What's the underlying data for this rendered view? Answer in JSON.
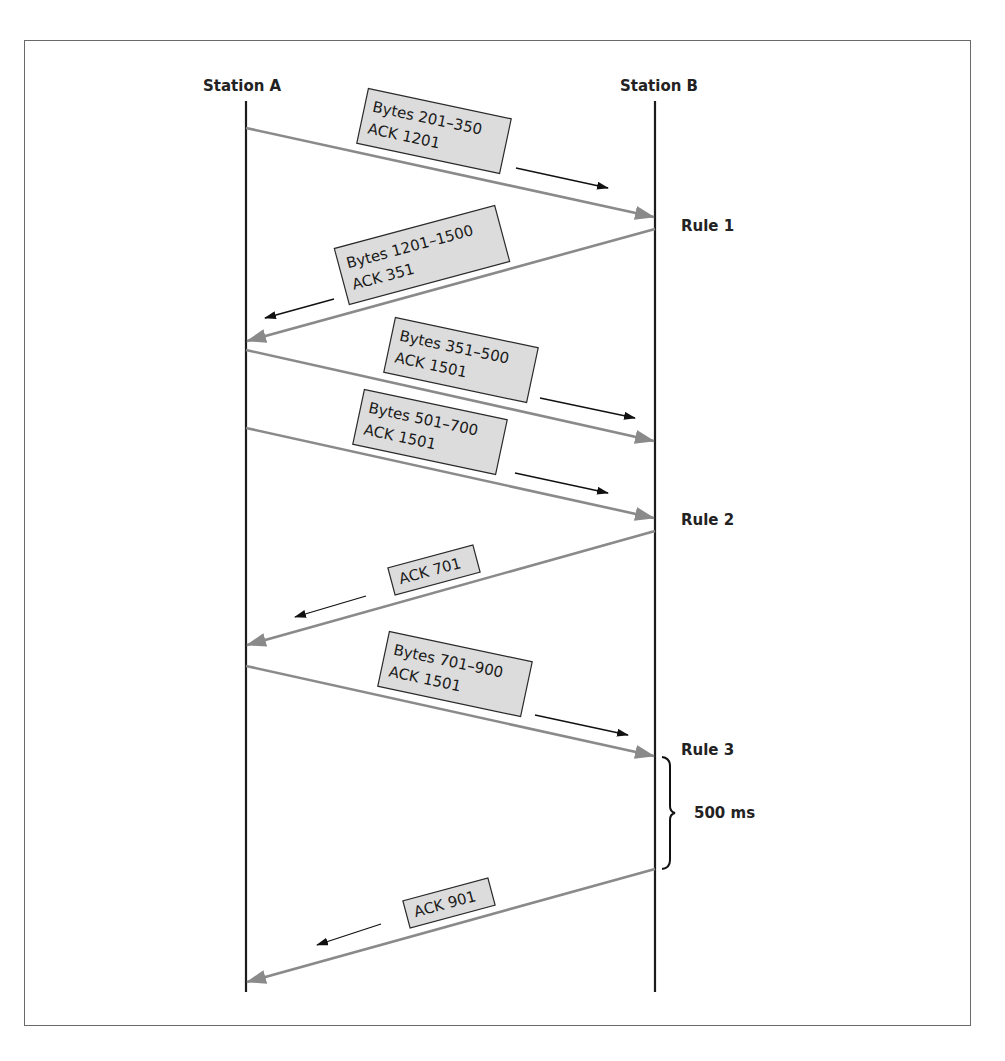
{
  "diagram": {
    "type": "sequence-diagram",
    "stations": [
      {
        "id": "A",
        "label": "Station A",
        "x": 246
      },
      {
        "id": "B",
        "label": "Station B",
        "x": 655
      }
    ],
    "lifeline": {
      "top": 101,
      "bottom": 992
    },
    "messages": [
      {
        "from": "A",
        "to": "B",
        "y_start": 128,
        "y_end": 217,
        "lines": [
          "Bytes 201–350",
          "ACK 1201"
        ],
        "box": {
          "cx": 434,
          "cy": 131,
          "w": 146,
          "h": 56,
          "angle": 12
        },
        "dir": {
          "x1": 516,
          "y1": 168,
          "x2": 608,
          "y2": 188
        }
      },
      {
        "from": "B",
        "to": "A",
        "y_start": 229,
        "y_end": 341,
        "lines": [
          "Bytes 1201–1500",
          "ACK 351"
        ],
        "box": {
          "cx": 422,
          "cy": 255,
          "w": 166,
          "h": 58,
          "angle": -15
        },
        "dir": {
          "x1": 334,
          "y1": 299,
          "x2": 265,
          "y2": 318
        }
      },
      {
        "from": "A",
        "to": "B",
        "y_start": 350,
        "y_end": 441,
        "lines": [
          "Bytes 351–500",
          "ACK 1501"
        ],
        "box": {
          "cx": 461,
          "cy": 360,
          "w": 146,
          "h": 56,
          "angle": 12
        },
        "dir": {
          "x1": 540,
          "y1": 398,
          "x2": 635,
          "y2": 418
        }
      },
      {
        "from": "A",
        "to": "B",
        "y_start": 428,
        "y_end": 518,
        "lines": [
          "Bytes 501–700",
          "ACK 1501"
        ],
        "box": {
          "cx": 430,
          "cy": 432,
          "w": 146,
          "h": 56,
          "angle": 12
        },
        "dir": {
          "x1": 515,
          "y1": 473,
          "x2": 608,
          "y2": 493
        }
      },
      {
        "from": "B",
        "to": "A",
        "y_start": 531,
        "y_end": 645,
        "lines": [
          "ACK 701"
        ],
        "box": {
          "cx": 434,
          "cy": 570,
          "w": 88,
          "h": 28,
          "angle": -15
        },
        "dir": {
          "x1": 366,
          "y1": 596,
          "x2": 295,
          "y2": 617
        }
      },
      {
        "from": "A",
        "to": "B",
        "y_start": 666,
        "y_end": 756,
        "lines": [
          "Bytes 701–900",
          "ACK 1501"
        ],
        "box": {
          "cx": 455,
          "cy": 674,
          "w": 146,
          "h": 56,
          "angle": 12
        },
        "dir": {
          "x1": 535,
          "y1": 715,
          "x2": 628,
          "y2": 735
        }
      },
      {
        "from": "B",
        "to": "A",
        "y_start": 869,
        "y_end": 982,
        "lines": [
          "ACK 901"
        ],
        "box": {
          "cx": 449,
          "cy": 903,
          "w": 88,
          "h": 28,
          "angle": -15
        },
        "dir": {
          "x1": 381,
          "y1": 924,
          "x2": 317,
          "y2": 945
        }
      }
    ],
    "rules": [
      {
        "label": "Rule 1",
        "x": 681,
        "y": 231
      },
      {
        "label": "Rule 2",
        "x": 681,
        "y": 525
      },
      {
        "label": "Rule 3",
        "x": 681,
        "y": 755
      }
    ],
    "timer": {
      "label": "500 ms",
      "x": 694,
      "y": 818,
      "brace_top": 756,
      "brace_bottom": 869,
      "brace_x": 663
    },
    "colors": {
      "message_line": "#8a8a8a",
      "box_fill": "#dcdcdc",
      "lifeline": "#1c1c1c",
      "frame": "#6a6a6a"
    }
  }
}
